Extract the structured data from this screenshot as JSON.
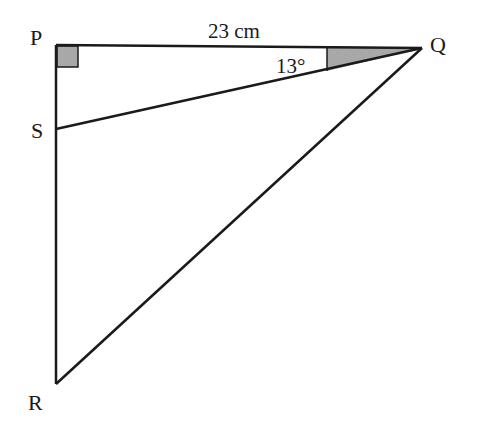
{
  "diagram": {
    "type": "geometry-triangle",
    "vertices": {
      "P": {
        "label": "P",
        "x": 56,
        "y": 45
      },
      "Q": {
        "label": "Q",
        "x": 422,
        "y": 48
      },
      "S": {
        "label": "S",
        "x": 56,
        "y": 129
      },
      "R": {
        "label": "R",
        "x": 56,
        "y": 384
      }
    },
    "labels": {
      "P": "P",
      "Q": "Q",
      "S": "S",
      "R": "R",
      "side_PQ": "23 cm",
      "angle_PQS": "13°"
    },
    "right_angle_at": "P",
    "colors": {
      "line": "#1a1a1a",
      "shade": "#a8a8a8",
      "background": "#ffffff"
    }
  }
}
